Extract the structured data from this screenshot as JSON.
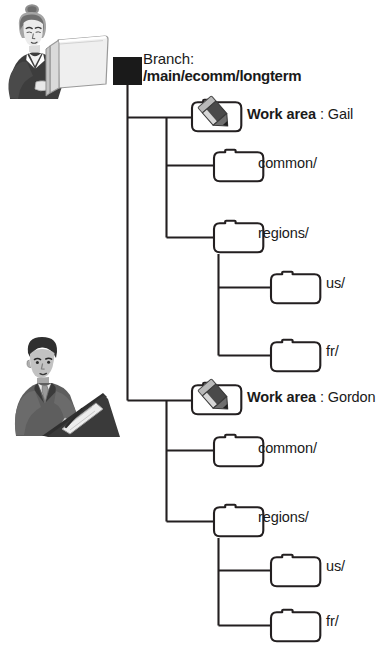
{
  "diagram": {
    "title_text": "Branch and work area tree",
    "colors": {
      "background": "#ffffff",
      "line": "#231f20",
      "root_node": "#1a1a1a",
      "folder_stroke": "#231f20",
      "folder_fill": "#ffffff",
      "pencil_dark": "#3f3f3f",
      "pencil_light": "#c9c9c9",
      "text": "#1a1a1a",
      "figure_dark": "#404040",
      "figure_mid": "#8a8a8a",
      "figure_light": "#d6d6d6"
    }
  },
  "root": {
    "node_name": "branch-node",
    "label_line1": "Branch:",
    "label_line2": "/main/ecomm/longterm"
  },
  "work_areas": [
    {
      "id": "gail",
      "icon": "folder-pencil-icon",
      "label_bold": "Work area",
      "label_rest": " : Gail",
      "owner": "Gail",
      "children": [
        {
          "id": "common-gail",
          "icon": "folder-icon",
          "label": "common/"
        },
        {
          "id": "regions-gail",
          "icon": "folder-icon",
          "label": "regions/",
          "children": [
            {
              "id": "us-gail",
              "icon": "folder-icon",
              "label": "us/"
            },
            {
              "id": "fr-gail",
              "icon": "folder-icon",
              "label": "fr/"
            }
          ]
        }
      ]
    },
    {
      "id": "gordon",
      "icon": "folder-pencil-icon",
      "label_bold": "Work area",
      "label_rest": " : Gordon",
      "owner": "Gordon",
      "children": [
        {
          "id": "common-gordon",
          "icon": "folder-icon",
          "label": "common/"
        },
        {
          "id": "regions-gordon",
          "icon": "folder-icon",
          "label": "regions/",
          "children": [
            {
              "id": "us-gordon",
              "icon": "folder-icon",
              "label": "us/"
            },
            {
              "id": "fr-gordon",
              "icon": "folder-icon",
              "label": "fr/"
            }
          ]
        }
      ]
    }
  ],
  "figures": [
    {
      "id": "reader",
      "icon": "person-reading-icon",
      "alt": "woman reading a book"
    },
    {
      "id": "writer",
      "icon": "person-writing-icon",
      "alt": "man writing at a desk"
    }
  ]
}
